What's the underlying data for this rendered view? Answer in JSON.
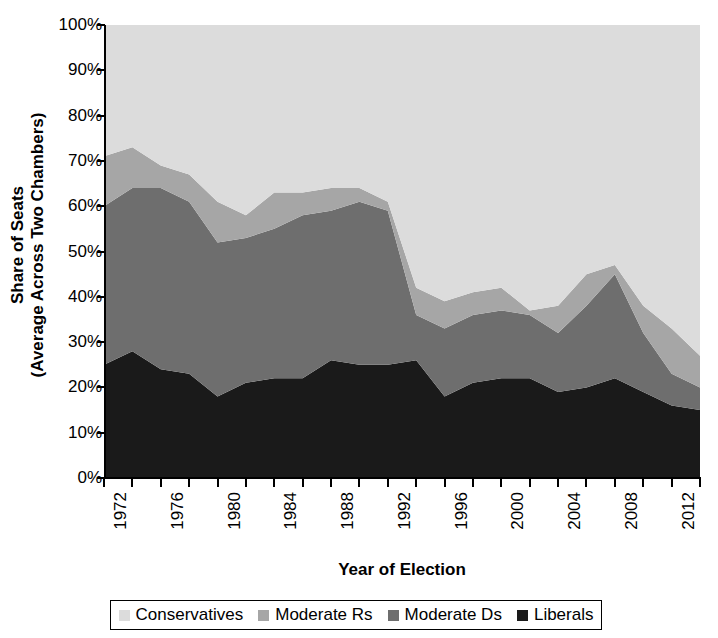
{
  "chart_data": {
    "type": "area",
    "title": "",
    "subtitle": "",
    "stacked": true,
    "xlabel": "Year of Election",
    "ylabel": "Share of Seats (Average Across Two Chambers)",
    "ylabel_line1": "Share of Seats",
    "ylabel_line2": "(Average Across Two Chambers)",
    "grid": false,
    "legend_position": "bottom",
    "xlim": [
      1972,
      2014
    ],
    "ylim": [
      0,
      100
    ],
    "y_tick_step": 10,
    "x_tick_step": 2,
    "x_label_step": 4,
    "ytick_labels": [
      "0%",
      "10%",
      "20%",
      "30%",
      "40%",
      "50%",
      "60%",
      "70%",
      "80%",
      "90%",
      "100%"
    ],
    "ytick_values": [
      0,
      10,
      20,
      30,
      40,
      50,
      60,
      70,
      80,
      90,
      100
    ],
    "x": [
      1972,
      1974,
      1976,
      1978,
      1980,
      1982,
      1984,
      1986,
      1988,
      1990,
      1992,
      1994,
      1996,
      1998,
      2000,
      2002,
      2004,
      2006,
      2008,
      2010,
      2012,
      2014
    ],
    "xtick_labels": [
      "1972",
      "",
      "1976",
      "",
      "1980",
      "",
      "1984",
      "",
      "1988",
      "",
      "1992",
      "",
      "1996",
      "",
      "2000",
      "",
      "2004",
      "",
      "2008",
      "",
      "2012",
      ""
    ],
    "x_labeled_values": [
      1972,
      1976,
      1980,
      1984,
      1988,
      1992,
      1996,
      2000,
      2004,
      2008,
      2012
    ],
    "series": [
      {
        "name": "Liberals",
        "color": "#1a1a1a",
        "values": [
          25,
          28,
          24,
          23,
          18,
          21,
          22,
          22,
          26,
          25,
          25,
          26,
          18,
          21,
          22,
          22,
          19,
          20,
          22,
          19,
          16,
          15
        ]
      },
      {
        "name": "Moderate Ds",
        "color": "#6e6e6e",
        "values": [
          35,
          36,
          40,
          38,
          34,
          32,
          33,
          36,
          33,
          36,
          34,
          10,
          15,
          15,
          15,
          14,
          13,
          18,
          23,
          13,
          7,
          5
        ]
      },
      {
        "name": "Moderate Rs",
        "color": "#a6a6a6",
        "values": [
          11,
          9,
          5,
          6,
          9,
          5,
          8,
          5,
          5,
          3,
          2,
          6,
          6,
          5,
          5,
          1,
          6,
          7,
          2,
          6,
          10,
          7
        ]
      },
      {
        "name": "Conservatives",
        "color": "#dcdcdc",
        "values": [
          29,
          27,
          31,
          33,
          39,
          42,
          37,
          37,
          36,
          36,
          39,
          58,
          61,
          59,
          58,
          63,
          62,
          55,
          53,
          62,
          67,
          73
        ]
      }
    ],
    "stack_order_bottom_to_top": [
      "Liberals",
      "Moderate Ds",
      "Moderate Rs",
      "Conservatives"
    ],
    "cumulative_tops": {
      "liberals": [
        25,
        28,
        24,
        23,
        18,
        21,
        22,
        22,
        26,
        25,
        25,
        26,
        18,
        21,
        22,
        22,
        19,
        20,
        22,
        19,
        16,
        15
      ],
      "moderate_ds": [
        60,
        64,
        64,
        61,
        52,
        53,
        55,
        58,
        59,
        61,
        59,
        36,
        33,
        36,
        37,
        36,
        32,
        38,
        45,
        32,
        23,
        20
      ],
      "moderate_rs": [
        71,
        73,
        69,
        67,
        61,
        58,
        63,
        63,
        64,
        64,
        61,
        42,
        39,
        41,
        42,
        37,
        38,
        45,
        47,
        38,
        33,
        27
      ],
      "conservatives": [
        100,
        100,
        100,
        100,
        100,
        100,
        100,
        100,
        100,
        100,
        100,
        100,
        100,
        100,
        100,
        100,
        100,
        100,
        100,
        100,
        100,
        100
      ]
    }
  },
  "legend": {
    "items": [
      {
        "label": "Conservatives",
        "color": "#dcdcdc"
      },
      {
        "label": "Moderate Rs",
        "color": "#a6a6a6"
      },
      {
        "label": "Moderate Ds",
        "color": "#6e6e6e"
      },
      {
        "label": "Liberals",
        "color": "#1a1a1a"
      }
    ]
  },
  "axes": {
    "x_title": "Year of Election",
    "y_title_line1": "Share of Seats",
    "y_title_line2": "(Average Across Two Chambers)"
  }
}
